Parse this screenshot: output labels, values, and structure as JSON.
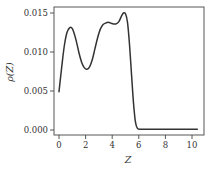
{
  "chart_data": {
    "type": "line",
    "title": "",
    "xlabel": "Z",
    "ylabel": "ρ(Z)",
    "xlim": [
      -0.4,
      10.85
    ],
    "ylim": [
      -0.0006,
      0.0157
    ],
    "xticks": [
      0,
      2,
      4,
      6,
      8,
      10
    ],
    "xtick_labels": [
      "0",
      "2",
      "4",
      "6",
      "8",
      "10"
    ],
    "yticks": [
      0.0,
      0.005,
      0.01,
      0.015
    ],
    "ytick_labels": [
      "0.000",
      "0.005",
      "0.010",
      "0.015"
    ],
    "grid": false,
    "legend": null,
    "line_color": "#333333",
    "series": [
      {
        "name": "ρ(Z)",
        "x": [
          0.0,
          0.2,
          0.4,
          0.6,
          0.8,
          0.95,
          1.1,
          1.3,
          1.5,
          1.7,
          1.9,
          2.1,
          2.3,
          2.5,
          2.7,
          2.9,
          3.1,
          3.3,
          3.5,
          3.7,
          3.9,
          4.1,
          4.3,
          4.5,
          4.7,
          4.85,
          5.0,
          5.15,
          5.3,
          5.45,
          5.6,
          5.75,
          5.9,
          6.1,
          6.5,
          7.0,
          8.0,
          9.0,
          10.0,
          10.4
        ],
        "y": [
          0.0049,
          0.008,
          0.0108,
          0.0125,
          0.0131,
          0.0131,
          0.0126,
          0.0114,
          0.0099,
          0.0087,
          0.008,
          0.0078,
          0.0081,
          0.009,
          0.0104,
          0.0118,
          0.0129,
          0.0135,
          0.0137,
          0.0138,
          0.0137,
          0.0136,
          0.0136,
          0.0139,
          0.0146,
          0.015,
          0.0149,
          0.0138,
          0.011,
          0.0072,
          0.0035,
          0.001,
          0.0002,
          0.0001,
          0.0001,
          0.0001,
          0.0001,
          0.0001,
          0.0001,
          0.0001
        ]
      }
    ]
  }
}
